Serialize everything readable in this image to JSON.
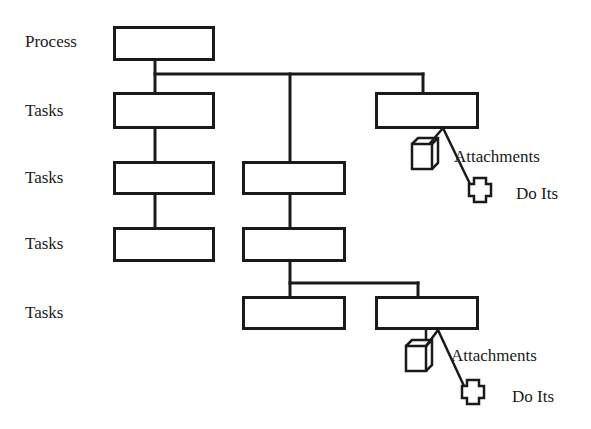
{
  "diagram": {
    "type": "process-hierarchy",
    "row_labels": [
      "Process",
      "Tasks",
      "Tasks",
      "Tasks",
      "Tasks"
    ],
    "annotations": {
      "top": {
        "attachments": "Attachments",
        "do_its": "Do Its"
      },
      "bottom": {
        "attachments": "Attachments",
        "do_its": "Do Its"
      }
    },
    "nodes": [
      {
        "id": "process",
        "level": "Process"
      },
      {
        "id": "task-1-1",
        "level": "Tasks",
        "parent": "process"
      },
      {
        "id": "task-1-2",
        "level": "Tasks",
        "parent": "process"
      },
      {
        "id": "task-1-3",
        "level": "Tasks",
        "parent": "process"
      },
      {
        "id": "task-2-1",
        "level": "Tasks",
        "parent": "task-1-1"
      },
      {
        "id": "task-2-2",
        "level": "Tasks",
        "parent": "task-1-2"
      },
      {
        "id": "task-3-1",
        "level": "Tasks",
        "parent": "task-2-1"
      },
      {
        "id": "task-3-2",
        "level": "Tasks",
        "parent": "task-2-2"
      },
      {
        "id": "task-4-1",
        "level": "Tasks",
        "parent": "task-3-2"
      },
      {
        "id": "task-4-2",
        "level": "Tasks",
        "parent": "task-3-2"
      }
    ],
    "stroke_color": "#1a1a1a",
    "background": "#ffffff"
  }
}
